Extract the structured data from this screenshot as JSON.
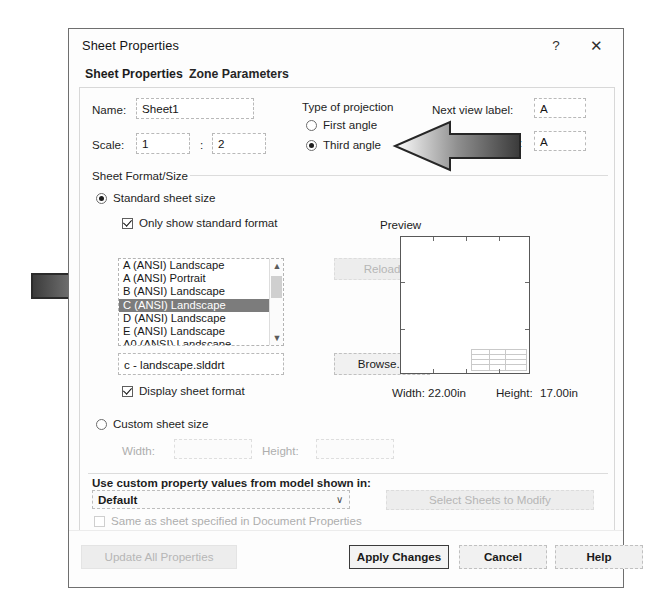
{
  "dialog": {
    "title": "Sheet Properties",
    "help_icon": "?",
    "close_icon": "✕",
    "tabs": [
      {
        "label": "Sheet Properties",
        "active": true
      },
      {
        "label": "Zone Parameters",
        "active": false
      }
    ]
  },
  "form": {
    "name_label": "Name:",
    "name_value": "Sheet1",
    "scale_label": "Scale:",
    "scale_numerator": "1",
    "scale_separator": ":",
    "scale_denominator": "2",
    "projection_group": "Type of projection",
    "projection_first": "First angle",
    "projection_third": "Third angle",
    "projection_selected": "Third angle",
    "next_view_label": "Next view label:",
    "next_view_value": "A",
    "next_datum_label": "Next datum label:",
    "next_datum_value": "A"
  },
  "sheet_format": {
    "group_label": "Sheet Format/Size",
    "standard_radio": "Standard sheet size",
    "standard_selected": true,
    "only_standard_checkbox": "Only show standard format",
    "only_standard_checked": true,
    "format_list": [
      "A (ANSI) Landscape",
      "A (ANSI) Portrait",
      "B (ANSI) Landscape",
      "C (ANSI) Landscape",
      "D (ANSI) Landscape",
      "E (ANSI) Landscape",
      "A0 (ANSI) Landscape"
    ],
    "format_selected_index": 3,
    "reload_button": "Reload",
    "reload_disabled": true,
    "format_file": "c - landscape.slddrt",
    "display_sheet_format_checkbox": "Display sheet format",
    "display_sheet_format_checked": true,
    "browse_button": "Browse...",
    "custom_radio": "Custom sheet size",
    "custom_selected": false,
    "custom_width_label": "Width:",
    "custom_width_value": "",
    "custom_height_label": "Height:",
    "custom_height_value": ""
  },
  "preview": {
    "label": "Preview",
    "width_label": "Width:",
    "width_value": "22.00in",
    "height_label": "Height:",
    "height_value": "17.00in"
  },
  "custom_properties": {
    "label": "Use custom property values from model shown in:",
    "dropdown_value": "Default",
    "dropdown_caret": "∨",
    "select_sheets_button": "Select Sheets to Modify",
    "select_sheets_disabled": true,
    "same_as_sheet_checkbox": "Same as sheet specified in Document Properties",
    "same_as_sheet_checked": false
  },
  "footer": {
    "update_all": "Update All Properties",
    "update_all_disabled": true,
    "apply": "Apply Changes",
    "cancel": "Cancel",
    "help": "Help"
  },
  "annotations": {
    "arrow_left_target": "Third angle",
    "arrow_right_target": "C (ANSI) Landscape"
  },
  "colors": {
    "selection": "#7c7c7c",
    "dialog_border": "#6f6f6f",
    "default_button_border": "#3b3b3b"
  }
}
